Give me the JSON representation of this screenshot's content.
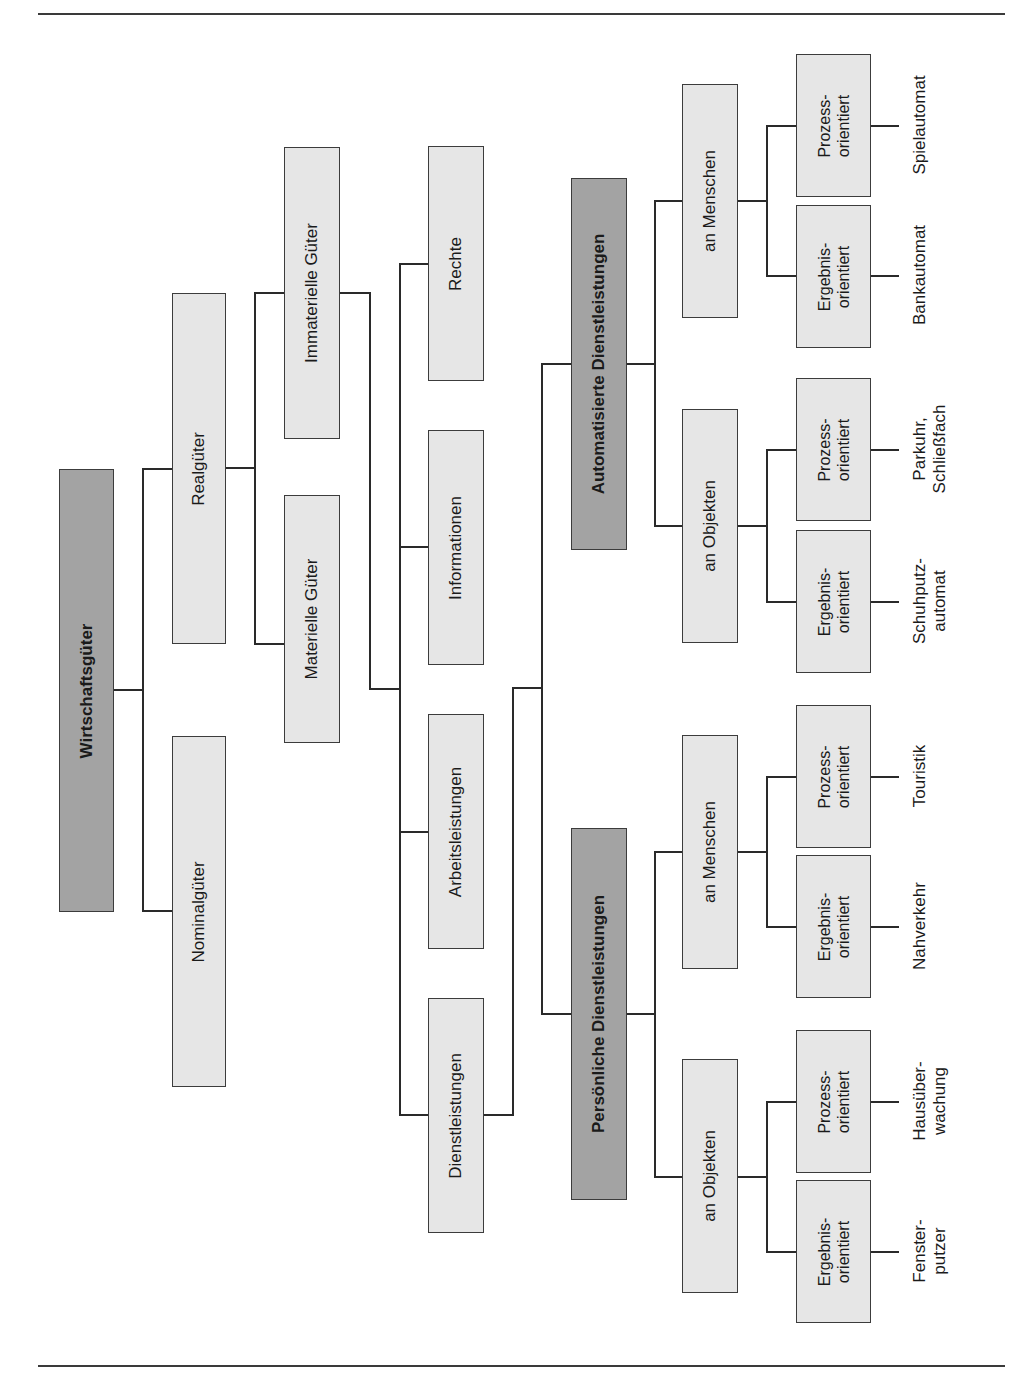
{
  "diagram": {
    "title": "Wirtschaftsgüter",
    "orientation": "rotated-90-ccw",
    "colors": {
      "root_fill": "#a3a3a3",
      "node_fill": "#e6e6e6",
      "line": "#2a2a2a",
      "border": "#3c3c3c"
    },
    "nodes": {
      "root": "Wirtschaftsgüter",
      "realgueter": "Realgüter",
      "nominalgueter": "Nominalgüter",
      "materielle": "Materielle Güter",
      "immaterielle": "Immaterielle Güter",
      "rechte": "Rechte",
      "informationen": "Informationen",
      "arbeitsleistungen": "Arbeitsleistungen",
      "dienstleistungen": "Dienstleistungen",
      "automatisierte": "Automatisierte Dienstleistungen",
      "persoenliche": "Persönliche Dienstleistungen",
      "auto_menschen": "an Menschen",
      "auto_objekten": "an Objekten",
      "pers_menschen": "an Menschen",
      "pers_objekten": "an Objekten",
      "prozess": "Prozess-\norientiert",
      "ergebnis": "Ergebnis-\norientiert"
    },
    "leaves": {
      "spielautomat": "Spielautomat",
      "bankautomat": "Bankautomat",
      "parkuhr": "Parkuhr,\nSchließfach",
      "schuhputz": "Schuhputz-\nautomat",
      "touristik": "Touristik",
      "nahverkehr": "Nahverkehr",
      "hausueberwachung": "Hausüber-\nwachung",
      "fensterputzer": "Fenster-\nputzer"
    },
    "edges": [
      [
        "Wirtschaftsgüter",
        "Realgüter"
      ],
      [
        "Wirtschaftsgüter",
        "Nominalgüter"
      ],
      [
        "Realgüter",
        "Materielle Güter"
      ],
      [
        "Realgüter",
        "Immaterielle Güter"
      ],
      [
        "Immaterielle Güter",
        "Rechte"
      ],
      [
        "Immaterielle Güter",
        "Informationen"
      ],
      [
        "Immaterielle Güter",
        "Arbeitsleistungen"
      ],
      [
        "Immaterielle Güter",
        "Dienstleistungen"
      ],
      [
        "Dienstleistungen",
        "Automatisierte Dienstleistungen"
      ],
      [
        "Dienstleistungen",
        "Persönliche Dienstleistungen"
      ],
      [
        "Automatisierte Dienstleistungen",
        "an Menschen"
      ],
      [
        "Automatisierte Dienstleistungen",
        "an Objekten"
      ],
      [
        "Persönliche Dienstleistungen",
        "an Menschen"
      ],
      [
        "Persönliche Dienstleistungen",
        "an Objekten"
      ]
    ]
  }
}
